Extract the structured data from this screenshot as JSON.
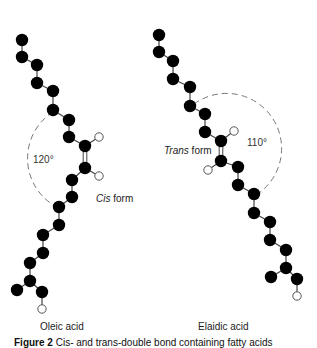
{
  "figure": {
    "left": {
      "name": "Oleic acid",
      "form_italic": "Cis",
      "form_suffix": " form",
      "angle": "120°",
      "carbons": [
        [
          22,
          40
        ],
        [
          22,
          57
        ],
        [
          37,
          65
        ],
        [
          37,
          83
        ],
        [
          53,
          91
        ],
        [
          53,
          110
        ],
        [
          69,
          120
        ],
        [
          69,
          137
        ],
        [
          85,
          146
        ],
        [
          85,
          168
        ],
        [
          72,
          180
        ],
        [
          72,
          197
        ],
        [
          59,
          207
        ],
        [
          59,
          225
        ],
        [
          43,
          235
        ],
        [
          43,
          253
        ],
        [
          30,
          263
        ],
        [
          30,
          281
        ],
        [
          17,
          290
        ],
        [
          42,
          292
        ]
      ],
      "bonds": [
        [
          0,
          1
        ],
        [
          1,
          2
        ],
        [
          2,
          3
        ],
        [
          3,
          4
        ],
        [
          4,
          5
        ],
        [
          5,
          6
        ],
        [
          6,
          7
        ],
        [
          7,
          8
        ],
        [
          9,
          10
        ],
        [
          10,
          11
        ],
        [
          11,
          12
        ],
        [
          12,
          13
        ],
        [
          13,
          14
        ],
        [
          14,
          15
        ],
        [
          15,
          16
        ],
        [
          16,
          17
        ],
        [
          17,
          18
        ],
        [
          17,
          19
        ]
      ],
      "double_bond": [
        8,
        9
      ],
      "double_bond_extra": [
        17,
        18
      ],
      "hydrogens": [
        {
          "at": [
            99,
            137
          ],
          "to": 8
        },
        {
          "at": [
            99,
            176
          ],
          "to": 9
        },
        {
          "at": [
            42,
            309
          ],
          "to": 19
        }
      ],
      "arc": {
        "path": "M53,112 A55,55 0 0 0 55,206"
      }
    },
    "right": {
      "name": "Elaidic acid",
      "form_italic": "Trans",
      "form_suffix": " form",
      "angle": "110°",
      "carbons": [
        [
          159,
          35
        ],
        [
          159,
          52
        ],
        [
          173,
          61
        ],
        [
          173,
          79
        ],
        [
          190,
          87
        ],
        [
          190,
          106
        ],
        [
          205,
          114
        ],
        [
          205,
          132
        ],
        [
          221,
          141
        ],
        [
          221,
          161
        ],
        [
          238,
          167
        ],
        [
          238,
          185
        ],
        [
          254,
          194
        ],
        [
          254,
          213
        ],
        [
          270,
          222
        ],
        [
          270,
          240
        ],
        [
          286,
          250
        ],
        [
          286,
          268
        ],
        [
          271,
          277
        ],
        [
          297,
          279
        ]
      ],
      "bonds": [
        [
          0,
          1
        ],
        [
          1,
          2
        ],
        [
          2,
          3
        ],
        [
          3,
          4
        ],
        [
          4,
          5
        ],
        [
          5,
          6
        ],
        [
          6,
          7
        ],
        [
          7,
          8
        ],
        [
          9,
          10
        ],
        [
          10,
          11
        ],
        [
          11,
          12
        ],
        [
          12,
          13
        ],
        [
          13,
          14
        ],
        [
          14,
          15
        ],
        [
          15,
          16
        ],
        [
          16,
          17
        ],
        [
          17,
          18
        ],
        [
          17,
          19
        ]
      ],
      "double_bond": [
        8,
        9
      ],
      "double_bond_extra": [
        17,
        18
      ],
      "hydrogens": [
        {
          "at": [
            234,
            131
          ],
          "to": 8
        },
        {
          "at": [
            208,
            170
          ],
          "to": 9
        },
        {
          "at": [
            297,
            296
          ],
          "to": 19
        }
      ],
      "arc": {
        "path": "M194,104 A55,55 0 1 1 259,193"
      }
    },
    "caption_label": "Figure 2",
    "caption_text": "   Cis- and trans-double bond containing fatty acids"
  }
}
